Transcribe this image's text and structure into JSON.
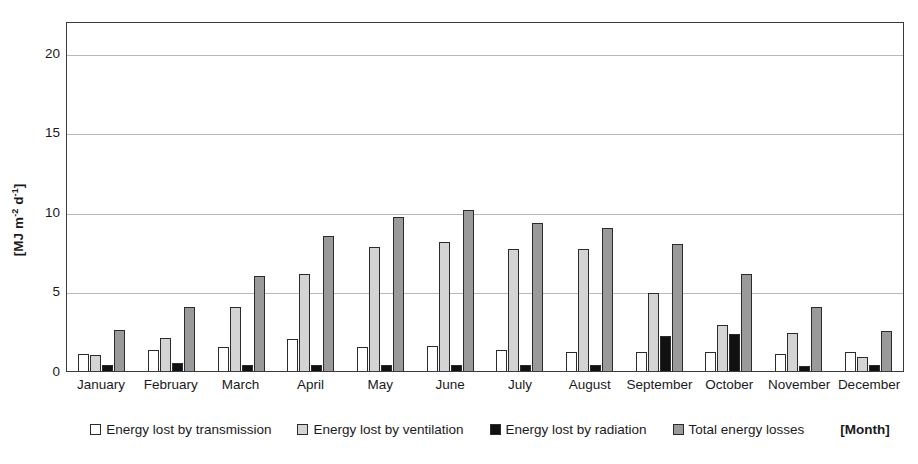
{
  "chart_data": {
    "type": "bar",
    "title": "",
    "xlabel": "[Month]",
    "ylabel": "[MJ m-2 d-1]",
    "ylabel_parts": {
      "prefix": "[MJ m",
      "sup1": "-2",
      "mid": " d",
      "sup2": "-1",
      "suffix": "]"
    },
    "ylim": [
      0,
      22
    ],
    "yticks": [
      0,
      5,
      10,
      15,
      20
    ],
    "grid": true,
    "legend_position": "bottom",
    "categories": [
      "January",
      "February",
      "March",
      "April",
      "May",
      "June",
      "July",
      "August",
      "September",
      "October",
      "November",
      "December"
    ],
    "series": [
      {
        "name": "Energy lost by transmission",
        "color": "#ffffff",
        "values": [
          1.1,
          1.3,
          1.5,
          2.0,
          1.5,
          1.6,
          1.3,
          1.2,
          1.2,
          1.2,
          1.1,
          1.2
        ]
      },
      {
        "name": "Energy lost by ventilation",
        "color": "#d4d4d4",
        "values": [
          1.0,
          2.1,
          4.0,
          6.1,
          7.8,
          8.1,
          7.7,
          7.7,
          4.9,
          2.9,
          2.4,
          0.9
        ]
      },
      {
        "name": "Energy lost by radiation",
        "color": "#111111",
        "values": [
          0.4,
          0.5,
          0.4,
          0.4,
          0.4,
          0.4,
          0.4,
          0.4,
          2.2,
          2.3,
          0.3,
          0.4
        ]
      },
      {
        "name": "Total energy losses",
        "color": "#9a9a9a",
        "values": [
          2.6,
          4.0,
          6.0,
          8.5,
          9.7,
          10.1,
          9.3,
          9.0,
          8.0,
          6.1,
          4.0,
          2.5
        ]
      }
    ]
  },
  "legend": {
    "items": [
      {
        "label": "Energy lost by transmission",
        "swatch": "#ffffff"
      },
      {
        "label": "Energy lost by ventilation",
        "swatch": "#d4d4d4"
      },
      {
        "label": "Energy lost by radiation",
        "swatch": "#111111"
      },
      {
        "label": "Total energy losses",
        "swatch": "#9a9a9a"
      }
    ],
    "axis_label": "[Month]"
  }
}
